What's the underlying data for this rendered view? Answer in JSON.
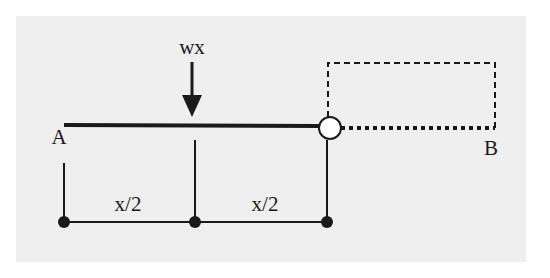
{
  "diagram": {
    "type": "beam-free-body",
    "load_label": "wx",
    "point_a_label": "A",
    "point_b_label": "B",
    "segment_labels": [
      "x/2",
      "x/2"
    ],
    "colors": {
      "background": "#ffffff",
      "panel": "#efefef",
      "ink": "#1a1a1a",
      "hinge_fill": "#ffffff"
    }
  }
}
